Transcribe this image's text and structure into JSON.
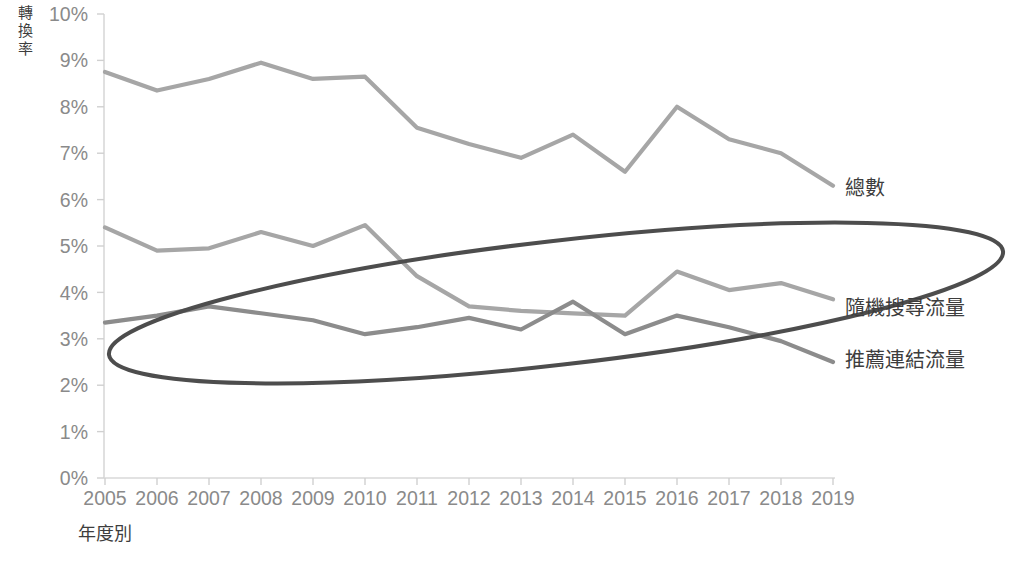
{
  "chart_data": {
    "type": "line",
    "title": "",
    "xlabel": "年度別",
    "ylabel": "轉換率",
    "x": [
      2005,
      2006,
      2007,
      2008,
      2009,
      2010,
      2011,
      2012,
      2013,
      2014,
      2015,
      2016,
      2017,
      2018,
      2019
    ],
    "categories": [
      "2005",
      "2006",
      "2007",
      "2008",
      "2009",
      "2010",
      "2011",
      "2012",
      "2013",
      "2014",
      "2015",
      "2016",
      "2017",
      "2018",
      "2019"
    ],
    "ylim": [
      0,
      10
    ],
    "ytick_labels": [
      "0%",
      "1%",
      "2%",
      "3%",
      "4%",
      "5%",
      "6%",
      "7%",
      "8%",
      "9%",
      "10%"
    ],
    "ytick_values": [
      0,
      1,
      2,
      3,
      4,
      5,
      6,
      7,
      8,
      9,
      10
    ],
    "yunit": "%",
    "grid": false,
    "legend_position": "right-inline",
    "series": [
      {
        "name": "總數",
        "color": "#a6a6a6",
        "values": [
          8.75,
          8.35,
          8.6,
          8.95,
          8.6,
          8.65,
          7.55,
          7.2,
          6.9,
          7.4,
          6.6,
          8.0,
          7.3,
          7.0,
          6.3
        ]
      },
      {
        "name": "隨機搜尋流量",
        "color": "#a6a6a6",
        "values": [
          5.4,
          4.9,
          4.95,
          5.3,
          5.0,
          5.45,
          4.35,
          3.7,
          3.6,
          3.55,
          3.5,
          4.45,
          4.05,
          4.2,
          3.85
        ]
      },
      {
        "name": "推薦連結流量",
        "color": "#8c8c8c",
        "values": [
          3.35,
          3.5,
          3.7,
          3.55,
          3.4,
          3.1,
          3.25,
          3.45,
          3.2,
          3.8,
          3.1,
          3.5,
          3.25,
          2.95,
          2.5
        ]
      }
    ],
    "annotations": [
      {
        "type": "ellipse",
        "name": "highlight-ellipse",
        "color": "#4d4d4d",
        "stroke_width": 4,
        "note": "rotated ellipse highlighting the two lower traffic-source series"
      }
    ]
  },
  "axes": {
    "y_title": "轉換率",
    "x_title": "年度別"
  },
  "colors": {
    "total_line": "#a6a6a6",
    "organic_line": "#a6a6a6",
    "referral_line": "#8c8c8c",
    "ellipse": "#4d4d4d",
    "axis": "#d9d9d9",
    "tick_text": "#8a8a8a",
    "label_text": "#3d3d3d"
  }
}
